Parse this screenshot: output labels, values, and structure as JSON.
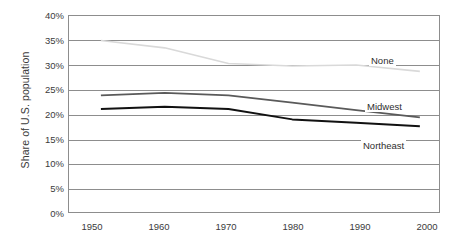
{
  "chart_data": {
    "type": "line",
    "title": "",
    "xlabel": "",
    "ylabel": "Share of U.S. population",
    "x": [
      1950,
      1960,
      1970,
      1980,
      1990,
      2000
    ],
    "xtick_labels": [
      "1950",
      "1960",
      "1970",
      "1980",
      "1990",
      "2000"
    ],
    "ytick_labels": [
      "40%",
      "35%",
      "30%",
      "25%",
      "20%",
      "15%",
      "10%",
      "5%",
      "0%"
    ],
    "ytick_values": [
      40,
      35,
      30,
      25,
      20,
      15,
      10,
      5,
      0
    ],
    "ylim": [
      0,
      40
    ],
    "xlim": [
      1945,
      2003
    ],
    "grid": "horizontal",
    "legend_position": "inline-right",
    "series": [
      {
        "name": "None",
        "color": "#d9d9d9",
        "width": 1.6,
        "label_text": "None",
        "values": [
          35.0,
          33.5,
          30.3,
          29.8,
          30.0,
          28.7
        ]
      },
      {
        "name": "Midwest",
        "color": "#5a5a5a",
        "width": 1.8,
        "label_text": "Midwest",
        "values": [
          23.8,
          24.3,
          23.8,
          22.3,
          20.8,
          19.3
        ]
      },
      {
        "name": "Northeast",
        "color": "#111111",
        "width": 2.0,
        "label_text": "Northeast",
        "values": [
          21.0,
          21.5,
          21.0,
          18.9,
          18.2,
          17.5
        ]
      }
    ],
    "labels": {
      "none": "None",
      "midwest": "Midwest",
      "northeast": "Northeast"
    },
    "axis_color": "#8d8d8d",
    "text_color": "#3b3b3b",
    "background": "#ffffff"
  }
}
